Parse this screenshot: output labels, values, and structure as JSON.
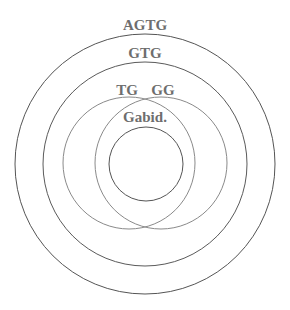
{
  "diagram": {
    "type": "nested-circles",
    "circles": [
      {
        "id": "agtg",
        "label": "AGTG",
        "cx": 145,
        "cy": 164,
        "r": 130,
        "stroke": "#555555",
        "label_x": 145,
        "label_y": 30
      },
      {
        "id": "gtg",
        "label": "GTG",
        "cx": 145,
        "cy": 164,
        "r": 102,
        "stroke": "#5a5a5a",
        "label_x": 145,
        "label_y": 58
      },
      {
        "id": "tg",
        "label": "TG",
        "cx": 129,
        "cy": 163,
        "r": 66,
        "stroke": "#8a8a8a",
        "label_x": 127,
        "label_y": 95
      },
      {
        "id": "gg",
        "label": "GG",
        "cx": 161,
        "cy": 163,
        "r": 66,
        "stroke": "#8a8a8a",
        "label_x": 163,
        "label_y": 95
      },
      {
        "id": "gabid",
        "label": "Gabid.",
        "cx": 146,
        "cy": 164,
        "r": 37,
        "stroke": "#555555",
        "label_x": 145,
        "label_y": 122
      }
    ]
  }
}
